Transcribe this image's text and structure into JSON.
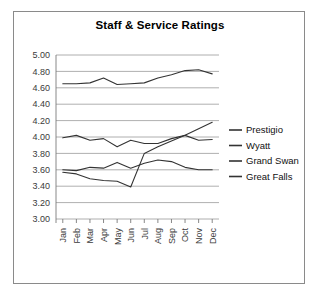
{
  "page": {
    "cropped_top_text": " "
  },
  "chart_data": {
    "type": "line",
    "title": "Staff & Service Ratings",
    "xlabel": "",
    "ylabel": "",
    "ylim": [
      3.0,
      5.0
    ],
    "ytick_step": 0.2,
    "ytick_labels": [
      "5.00",
      "4.80",
      "4.60",
      "4.40",
      "4.20",
      "4.00",
      "3.80",
      "3.60",
      "3.40",
      "3.20",
      "3.00"
    ],
    "grid": true,
    "legend_position": "right",
    "categories": [
      "Jan",
      "Feb",
      "Mar",
      "Apr",
      "May",
      "Jun",
      "Jul",
      "Aug",
      "Sep",
      "Oct",
      "Nov",
      "Dec"
    ],
    "series": [
      {
        "name": "Prestigio",
        "values": [
          4.65,
          4.65,
          4.66,
          4.72,
          4.64,
          4.65,
          4.66,
          4.72,
          4.76,
          4.81,
          4.82,
          4.77
        ]
      },
      {
        "name": "Wyatt",
        "values": [
          3.99,
          4.02,
          3.96,
          3.98,
          3.88,
          3.96,
          3.92,
          3.92,
          3.98,
          4.02,
          3.96,
          3.97
        ]
      },
      {
        "name": "Grand Swan",
        "values": [
          3.6,
          3.59,
          3.63,
          3.62,
          3.69,
          3.62,
          3.68,
          3.72,
          3.7,
          3.63,
          3.6,
          3.6
        ]
      },
      {
        "name": "Great Falls",
        "values": [
          3.57,
          3.55,
          3.49,
          3.47,
          3.46,
          3.39,
          3.8,
          3.88,
          3.95,
          4.02,
          4.1,
          4.18
        ]
      }
    ]
  },
  "legend": {
    "items": [
      "Prestigio",
      "Wyatt",
      "Grand Swan",
      "Great Falls"
    ]
  },
  "colors": {
    "series_stroke": "#333333",
    "gridline": "#9a9a9a",
    "frame_border": "#8a8a8a",
    "text": "#000000"
  }
}
